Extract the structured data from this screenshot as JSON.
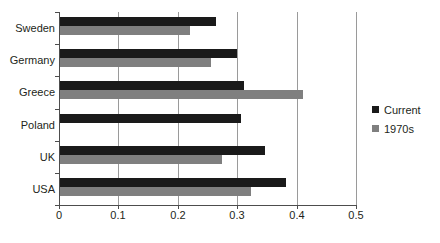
{
  "chart_data": {
    "type": "bar",
    "orientation": "horizontal",
    "title": "",
    "xlabel": "",
    "ylabel": "",
    "categories": [
      "Sweden",
      "Germany",
      "Greece",
      "Poland",
      "UK",
      "USA"
    ],
    "series": [
      {
        "name": "Current",
        "color": "#1a1a1a",
        "values": [
          0.264,
          0.299,
          0.311,
          0.307,
          0.346,
          0.382
        ]
      },
      {
        "name": "1970s",
        "color": "#7f7f7f",
        "values": [
          0.221,
          0.256,
          0.41,
          null,
          0.275,
          0.323
        ]
      }
    ],
    "xlim": [
      0,
      0.5
    ],
    "xticks": [
      0,
      0.1,
      0.2,
      0.3,
      0.4,
      0.5
    ],
    "xtick_labels": [
      "0",
      "0.1",
      "0.2",
      "0.3",
      "0.4",
      "0.5"
    ],
    "grid": "vertical",
    "legend_position": "right",
    "legend_entries": [
      "Current",
      "1970s"
    ]
  },
  "colors": {
    "current": "#1a1a1a",
    "1970s": "#7f7f7f",
    "axis": "#4d4d4d",
    "gridline": "#9a9a9a",
    "background": "#ffffff"
  }
}
